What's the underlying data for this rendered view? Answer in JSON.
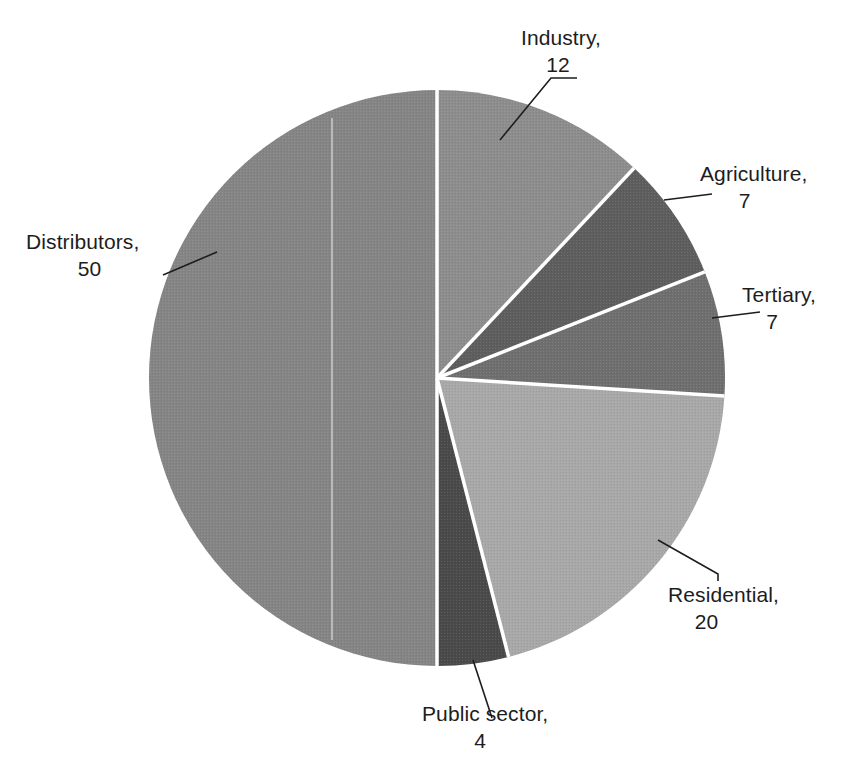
{
  "chart_data": {
    "type": "pie",
    "title": "",
    "subtitle": "",
    "xlabel": "",
    "ylabel": "",
    "legend_position": "none",
    "grid": false,
    "units": "percent",
    "total": 100,
    "start_angle_deg": 0,
    "direction": "clockwise",
    "categories": [
      "Industry",
      "Agriculture",
      "Tertiary",
      "Residential",
      "Public sector",
      "Distributors"
    ],
    "values": [
      12,
      7,
      7,
      20,
      4,
      50
    ],
    "slices": [
      {
        "name": "Industry",
        "value": 12,
        "label_name": "Industry,",
        "label_value": "12",
        "color": "#8d8d8d",
        "start_deg": 0,
        "end_deg": 43.2
      },
      {
        "name": "Agriculture",
        "value": 7,
        "label_name": "Agriculture,",
        "label_value": "7",
        "color": "#5e5e5e",
        "start_deg": 43.2,
        "end_deg": 68.4
      },
      {
        "name": "Tertiary",
        "value": 7,
        "label_name": "Tertiary,",
        "label_value": "7",
        "color": "#6f6f6f",
        "start_deg": 68.4,
        "end_deg": 93.6
      },
      {
        "name": "Residential",
        "value": 20,
        "label_name": "Residential,",
        "label_value": "20",
        "color": "#a8a8a8",
        "start_deg": 93.6,
        "end_deg": 165.6
      },
      {
        "name": "Public sector",
        "value": 4,
        "label_name": "Public sector,",
        "label_value": "4",
        "color": "#4a4a4a",
        "start_deg": 165.6,
        "end_deg": 180.0
      },
      {
        "name": "Distributors",
        "value": 50,
        "label_name": "Distributors,",
        "label_value": "50",
        "color": "#858585",
        "start_deg": 180.0,
        "end_deg": 360.0
      }
    ],
    "geometry": {
      "center_x": 437,
      "center_y": 378,
      "radius": 288,
      "separator_color": "#ffffff",
      "separator_width": 3
    },
    "background_color": "#ffffff",
    "text_color": "#1d1d1d"
  }
}
